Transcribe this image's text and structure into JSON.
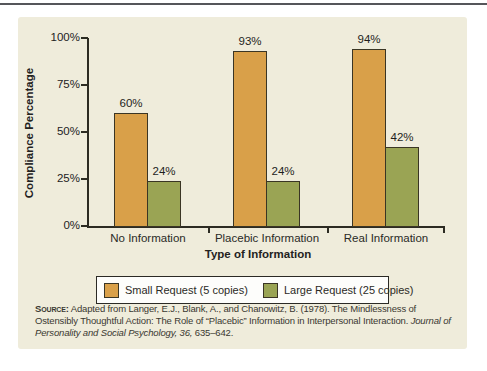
{
  "page": {
    "background": "#ffffff",
    "rule_color": "#55565a"
  },
  "panel": {
    "background": "#efecdb"
  },
  "chart_data": {
    "type": "bar",
    "title": "",
    "categories": [
      "No Information",
      "Placebic Information",
      "Real Information"
    ],
    "series": [
      {
        "name": "Small Request (5 copies)",
        "color": "#d9a049",
        "values": [
          60,
          93,
          94
        ]
      },
      {
        "name": "Large Request (25 copies)",
        "color": "#9aa454",
        "values": [
          24,
          24,
          42
        ]
      }
    ],
    "value_suffix": "%",
    "xlabel": "Type of Information",
    "ylabel": "Compliance Percentage",
    "ylim": [
      0,
      100
    ],
    "yticks": [
      {
        "value": 0,
        "label": "0%"
      },
      {
        "value": 25,
        "label": "25%"
      },
      {
        "value": 50,
        "label": "50%"
      },
      {
        "value": 75,
        "label": "75%"
      },
      {
        "value": 100,
        "label": "100%"
      }
    ],
    "grid": false,
    "legend_position": "bottom",
    "bar_outline_color": "#3a3524",
    "axis_color": "#2c2b22"
  },
  "source": {
    "label": "Source:",
    "segments": [
      {
        "text": " Adapted from Langer, E.J., Blank, A., and Chanowitz, B. (1978). The Mindlessness of Ostensibly Thoughtful Action: The Role of “Placebic” Information in Interpersonal Interaction. ",
        "italic": false
      },
      {
        "text": "Journal of Personality and Social Psychology, 36,",
        "italic": true
      },
      {
        "text": " 635–642.",
        "italic": false
      }
    ]
  }
}
